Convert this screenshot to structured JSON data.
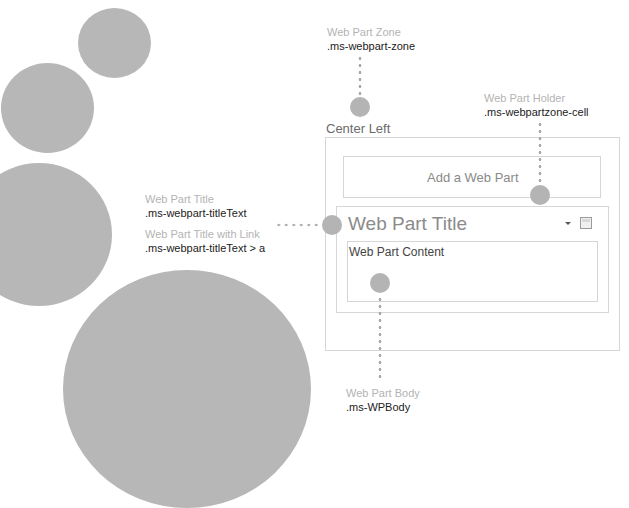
{
  "zone": {
    "title": "Center Left",
    "add_web_part_label": "Add a Web Part"
  },
  "web_part": {
    "title": "Web Part Title",
    "content": "Web Part Content",
    "menu_icon": "dropdown-arrow-icon",
    "select_icon": "checkbox-icon"
  },
  "callouts": {
    "zone": {
      "name": "Web Part Zone",
      "class": ".ms-webpart-zone"
    },
    "holder": {
      "name": "Web Part Holder",
      "class": ".ms-webpartzone-cell"
    },
    "title": {
      "name": "Web Part Title",
      "class": ".ms-webpart-titleText"
    },
    "title_link": {
      "name": "Web Part Title with Link",
      "class": ".ms-webpart-titleText > a"
    },
    "body": {
      "name": "Web Part Body",
      "class": ".ms-WPBody"
    }
  },
  "colors": {
    "circle": "#b7b7b7",
    "border": "#d6d6d6",
    "label_muted": "#b3b3b3",
    "label_dark": "#222222"
  }
}
